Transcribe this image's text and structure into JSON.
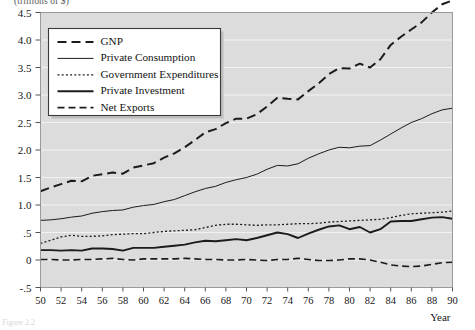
{
  "figure": {
    "unit_label": "(trillions of $)",
    "caption": "Figure 2.2"
  },
  "chart_data": {
    "type": "line",
    "title": "",
    "xlabel": "Year",
    "ylabel": "(trillions of $)",
    "xlim": [
      50,
      90
    ],
    "ylim": [
      -0.5,
      4.5
    ],
    "grid": true,
    "legend_position": "top-left",
    "xticks": [
      50,
      52,
      54,
      56,
      58,
      60,
      62,
      64,
      66,
      68,
      70,
      72,
      74,
      76,
      78,
      80,
      82,
      84,
      86,
      88,
      90
    ],
    "xtick_labels": [
      "50",
      "52",
      "54",
      "56",
      "58",
      "60",
      "62",
      "64",
      "66",
      "68",
      "70",
      "72",
      "74",
      "76",
      "78",
      "80",
      "82",
      "84",
      "86",
      "88",
      "90"
    ],
    "yticks": [
      -0.5,
      0,
      0.5,
      1.0,
      1.5,
      2.0,
      2.5,
      3.0,
      3.5,
      4.0,
      4.5
    ],
    "ytick_labels": [
      "-.5",
      "0",
      ".5",
      "1.0",
      "1.5",
      "2.0",
      "2.5",
      "3.0",
      "3.5",
      "4.0",
      "4.5"
    ],
    "x": [
      50,
      51,
      52,
      53,
      54,
      55,
      56,
      57,
      58,
      59,
      60,
      61,
      62,
      63,
      64,
      65,
      66,
      67,
      68,
      69,
      70,
      71,
      72,
      73,
      74,
      75,
      76,
      77,
      78,
      79,
      80,
      81,
      82,
      83,
      84,
      85,
      86,
      87,
      88,
      89,
      90
    ],
    "series": [
      {
        "name": "GNP",
        "style": "dashed",
        "width": 2.0,
        "values": [
          1.25,
          1.32,
          1.38,
          1.44,
          1.43,
          1.53,
          1.56,
          1.59,
          1.57,
          1.68,
          1.72,
          1.76,
          1.86,
          1.94,
          2.05,
          2.18,
          2.32,
          2.38,
          2.49,
          2.57,
          2.57,
          2.65,
          2.79,
          2.95,
          2.93,
          2.92,
          3.07,
          3.21,
          3.38,
          3.49,
          3.48,
          3.57,
          3.5,
          3.65,
          3.91,
          4.06,
          4.19,
          4.32,
          4.5,
          4.65,
          4.72
        ]
      },
      {
        "name": "Private Consumption",
        "style": "solid",
        "width": 1.0,
        "values": [
          0.72,
          0.73,
          0.75,
          0.78,
          0.8,
          0.85,
          0.88,
          0.9,
          0.91,
          0.96,
          0.99,
          1.01,
          1.06,
          1.1,
          1.17,
          1.24,
          1.3,
          1.34,
          1.41,
          1.46,
          1.5,
          1.56,
          1.65,
          1.72,
          1.71,
          1.75,
          1.85,
          1.93,
          2.0,
          2.05,
          2.04,
          2.07,
          2.08,
          2.18,
          2.29,
          2.4,
          2.5,
          2.57,
          2.66,
          2.73,
          2.76
        ]
      },
      {
        "name": "Government Expenditures",
        "style": "dotted",
        "width": 1.3,
        "values": [
          0.3,
          0.36,
          0.42,
          0.45,
          0.43,
          0.43,
          0.44,
          0.46,
          0.47,
          0.48,
          0.48,
          0.5,
          0.52,
          0.53,
          0.54,
          0.55,
          0.59,
          0.63,
          0.65,
          0.65,
          0.64,
          0.63,
          0.64,
          0.64,
          0.65,
          0.66,
          0.66,
          0.67,
          0.69,
          0.7,
          0.71,
          0.72,
          0.73,
          0.74,
          0.77,
          0.81,
          0.84,
          0.85,
          0.86,
          0.87,
          0.89
        ]
      },
      {
        "name": "Private Investment",
        "style": "solid",
        "width": 1.9,
        "values": [
          0.18,
          0.18,
          0.17,
          0.18,
          0.17,
          0.21,
          0.21,
          0.2,
          0.17,
          0.22,
          0.22,
          0.22,
          0.24,
          0.26,
          0.28,
          0.32,
          0.35,
          0.34,
          0.36,
          0.38,
          0.36,
          0.4,
          0.45,
          0.5,
          0.47,
          0.4,
          0.48,
          0.55,
          0.61,
          0.63,
          0.56,
          0.6,
          0.5,
          0.56,
          0.7,
          0.71,
          0.71,
          0.74,
          0.77,
          0.78,
          0.75
        ]
      },
      {
        "name": "Net Exports",
        "style": "dashed",
        "width": 1.6,
        "values": [
          0.01,
          0.01,
          0.0,
          0.0,
          0.01,
          0.01,
          0.02,
          0.03,
          0.01,
          0.0,
          0.02,
          0.02,
          0.02,
          0.02,
          0.03,
          0.02,
          0.01,
          0.01,
          0.0,
          0.0,
          0.01,
          0.0,
          -0.01,
          0.01,
          0.01,
          0.03,
          0.01,
          -0.01,
          -0.01,
          0.0,
          0.02,
          0.02,
          0.0,
          -0.04,
          -0.09,
          -0.11,
          -0.12,
          -0.11,
          -0.08,
          -0.05,
          -0.04
        ]
      }
    ]
  },
  "legend": {
    "items": [
      {
        "label": "GNP"
      },
      {
        "label": "Private Consumption"
      },
      {
        "label": "Government Expenditures"
      },
      {
        "label": "Private Investment"
      },
      {
        "label": "Net Exports"
      }
    ]
  }
}
